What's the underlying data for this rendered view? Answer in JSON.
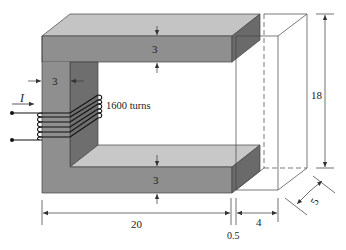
{
  "diagram": {
    "type": "magnetic core with air gap",
    "colors": {
      "core_front": "#8f8f8f",
      "core_top": "#c4c4c4",
      "core_side_dark": "#6a6a6a",
      "coil": "#1a1a1a",
      "lines": "#333333"
    },
    "labels": {
      "current": "I",
      "turns": "1600 turns",
      "top_bar_thickness": "3",
      "left_leg_thickness": "3",
      "bottom_bar_thickness": "3",
      "height": "18",
      "length": "20",
      "gap": "0.5",
      "right_width": "4",
      "depth": "5"
    }
  }
}
